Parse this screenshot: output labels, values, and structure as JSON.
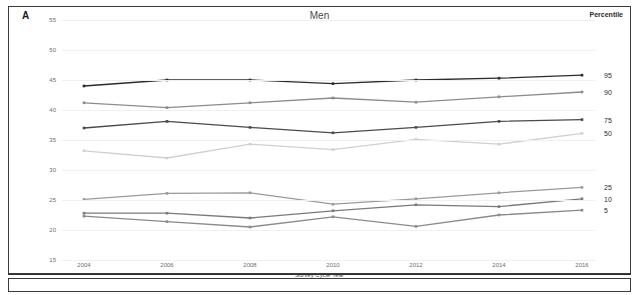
{
  "panel": {
    "letter": "A",
    "title": "Men",
    "percentile_header": "Percentile"
  },
  "chart_data": {
    "type": "line",
    "title": "Men",
    "xlabel": "Survey Cycle Year",
    "ylabel": "Body Mass Index",
    "x": [
      2004,
      2006,
      2008,
      2010,
      2012,
      2014,
      2016
    ],
    "xticklabels": [
      "2004",
      "2006",
      "2008",
      "2010",
      "2012",
      "2014",
      "2016"
    ],
    "yticklabels": [
      "15",
      "20",
      "25",
      "30",
      "35",
      "40",
      "45",
      "50",
      "55"
    ],
    "ylim": [
      15,
      55
    ],
    "ytick_step": 5,
    "grid": true,
    "legend_position": "right",
    "series": [
      {
        "name": "95",
        "label": "95",
        "color": "#2b2b2b",
        "values": [
          44.0,
          45.0,
          45.0,
          44.4,
          45.0,
          45.3,
          45.8
        ]
      },
      {
        "name": "90",
        "label": "90",
        "color": "#8c8c8c",
        "values": [
          41.2,
          40.4,
          41.2,
          42.0,
          41.3,
          42.2,
          43.0
        ]
      },
      {
        "name": "75",
        "label": "75",
        "color": "#4a4a4a",
        "values": [
          37.0,
          38.1,
          37.1,
          36.2,
          37.1,
          38.1,
          38.4
        ]
      },
      {
        "name": "50",
        "label": "50",
        "color": "#d0d0d0",
        "values": [
          33.2,
          32.0,
          34.3,
          33.4,
          35.1,
          34.3,
          36.1
        ]
      },
      {
        "name": "25",
        "label": "25",
        "color": "#9a9a9a",
        "values": [
          25.1,
          26.1,
          26.2,
          24.3,
          25.2,
          26.2,
          27.1
        ]
      },
      {
        "name": "10",
        "label": "10",
        "color": "#7a7a7a",
        "values": [
          22.8,
          22.8,
          22.0,
          23.2,
          24.2,
          23.9,
          25.2
        ]
      },
      {
        "name": "5",
        "label": "5",
        "color": "#8a8a8a",
        "values": [
          22.3,
          21.4,
          20.5,
          22.2,
          20.6,
          22.5,
          23.3
        ]
      }
    ]
  }
}
